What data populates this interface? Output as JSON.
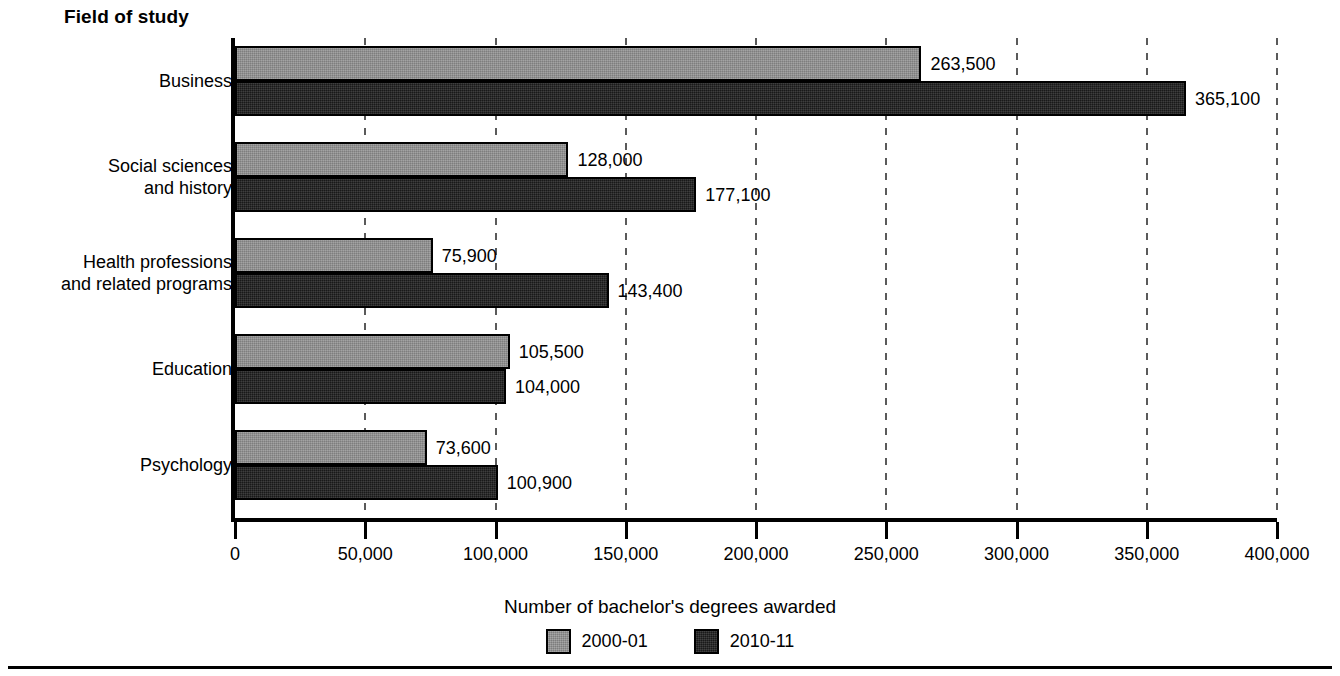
{
  "chart_data": {
    "type": "bar",
    "orientation": "horizontal",
    "title": "",
    "xlabel": "Number of bachelor's degrees awarded",
    "ylabel": "Field of study",
    "xlim": [
      0,
      400000
    ],
    "xticks": [
      "0",
      "50,000",
      "100,000",
      "150,000",
      "200,000",
      "250,000",
      "300,000",
      "350,000",
      "400,000"
    ],
    "xtick_values": [
      0,
      50000,
      100000,
      150000,
      200000,
      250000,
      300000,
      350000,
      400000
    ],
    "grid": true,
    "legend_position": "bottom",
    "categories": [
      "Business",
      "Social sciences\nand history",
      "Health professions\nand related programs",
      "Education",
      "Psychology"
    ],
    "series": [
      {
        "name": "2000-01",
        "color": "#8c8c8c",
        "values": [
          263500,
          128000,
          75900,
          105500,
          73600
        ],
        "labels": [
          "263,500",
          "128,000",
          "75,900",
          "105,500",
          "73,600"
        ]
      },
      {
        "name": "2010-11",
        "color": "#1f1f1f",
        "values": [
          365100,
          177100,
          143400,
          104000,
          100900
        ],
        "labels": [
          "365,100",
          "177,100",
          "143,400",
          "104,000",
          "100,900"
        ]
      }
    ]
  },
  "legend": {
    "items": [
      {
        "label": "2000-01",
        "series": 0
      },
      {
        "label": "2010-11",
        "series": 1
      }
    ]
  }
}
